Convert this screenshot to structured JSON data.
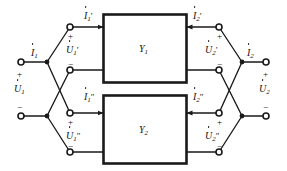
{
  "diagram": {
    "stroke_color": "#1a1a1a",
    "background": "#ffffff"
  },
  "blocks": [
    {
      "name": "block-y1",
      "label": "Y",
      "sub": "1"
    },
    {
      "name": "block-y2",
      "label": "Y",
      "sub": "2"
    }
  ],
  "ports": {
    "input": {
      "current_label": {
        "base": "I",
        "sub": "1",
        "prime": ""
      },
      "voltage_label": {
        "base": "U",
        "sub": "1",
        "prime": ""
      },
      "plus": "+",
      "minus": "−"
    },
    "output": {
      "current_label": {
        "base": "I",
        "sub": "2",
        "prime": ""
      },
      "voltage_label": {
        "base": "U",
        "sub": "2",
        "prime": ""
      },
      "plus": "+",
      "minus": "−"
    },
    "y1_left": {
      "current_label": {
        "base": "I",
        "sub": "1",
        "prime": "′"
      },
      "voltage_label": {
        "base": "U",
        "sub": "1",
        "prime": "′"
      },
      "plus": "+",
      "minus": "−"
    },
    "y1_right": {
      "current_label": {
        "base": "I",
        "sub": "2",
        "prime": "′"
      },
      "voltage_label": {
        "base": "U",
        "sub": "2",
        "prime": "′"
      },
      "plus": "+",
      "minus": "−"
    },
    "y2_left": {
      "current_label": {
        "base": "I",
        "sub": "1",
        "prime": "″"
      },
      "voltage_label": {
        "base": "U",
        "sub": "1",
        "prime": "″"
      },
      "plus": "+",
      "minus": "−"
    },
    "y2_right": {
      "current_label": {
        "base": "I",
        "sub": "2",
        "prime": "″"
      },
      "voltage_label": {
        "base": "U",
        "sub": "2",
        "prime": "″"
      },
      "plus": "+",
      "minus": "−"
    }
  }
}
